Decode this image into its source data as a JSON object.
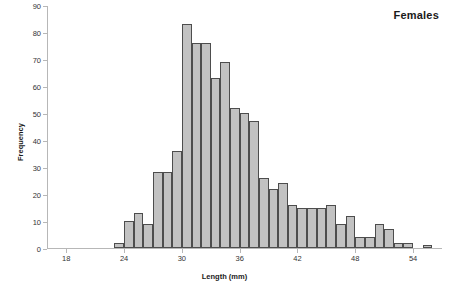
{
  "chart_data": {
    "type": "bar",
    "title": "Females",
    "xlabel": "Length (mm)",
    "ylabel": "Frequency",
    "grid": false,
    "legend": null,
    "xlim": [
      16,
      57
    ],
    "ylim": [
      0,
      90
    ],
    "xticks": [
      18,
      24,
      30,
      36,
      42,
      48,
      54
    ],
    "yticks": [
      0,
      10,
      20,
      30,
      40,
      50,
      60,
      70,
      80,
      90
    ],
    "bin_width": 1,
    "categories": [
      23,
      24,
      25,
      26,
      27,
      28,
      29,
      30,
      31,
      32,
      33,
      34,
      35,
      36,
      37,
      38,
      39,
      40,
      41,
      42,
      43,
      44,
      45,
      46,
      47,
      48,
      49,
      50,
      51,
      52,
      53,
      55
    ],
    "values": [
      2,
      10,
      13,
      9,
      28,
      28,
      36,
      83,
      76,
      76,
      63,
      69,
      52,
      50,
      47,
      26,
      22,
      24,
      16,
      15,
      15,
      15,
      16,
      9,
      12,
      4,
      4,
      9,
      7,
      2,
      2,
      1
    ],
    "series": [
      {
        "name": "Females",
        "values": [
          2,
          10,
          13,
          9,
          28,
          28,
          36,
          83,
          76,
          76,
          63,
          69,
          52,
          50,
          47,
          26,
          22,
          24,
          16,
          15,
          15,
          15,
          16,
          9,
          12,
          4,
          4,
          9,
          7,
          2,
          2,
          1
        ]
      }
    ],
    "colors": {
      "bar_fill": "#c2c2c2",
      "bar_stroke": "#4d4d4d",
      "axis": "#b7b7b7",
      "text": "#1a1a1a",
      "background": "#ffffff"
    }
  }
}
